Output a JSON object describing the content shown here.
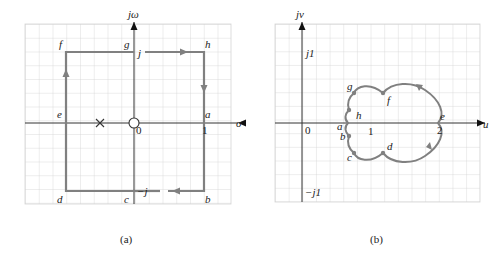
{
  "colors": {
    "grid": "#d4d4d4",
    "axis": "#333333",
    "contour": "#808080",
    "text": "#222222"
  },
  "panel_a": {
    "caption": "(a)",
    "axis_labels": {
      "vertical": "jω",
      "horizontal": "σ"
    },
    "tick_labels": {
      "origin": "0",
      "one": "1",
      "j": "j",
      "minus_j": "−j"
    },
    "points": {
      "a": "a",
      "b": "b",
      "c": "c",
      "d": "d",
      "e": "e",
      "f": "f",
      "g": "g",
      "h": "h"
    },
    "pole_marker": "×",
    "zero_marker": "○"
  },
  "panel_b": {
    "caption": "(b)",
    "axis_labels": {
      "vertical": "jv",
      "horizontal": "u"
    },
    "tick_labels": {
      "origin": "0",
      "one": "1",
      "two": "2",
      "j1": "j1",
      "minus_j1": "−j1"
    },
    "points": {
      "a": "a",
      "b": "b",
      "c": "c",
      "d": "d",
      "e": "e",
      "f": "f",
      "g": "g",
      "h": "h"
    }
  }
}
